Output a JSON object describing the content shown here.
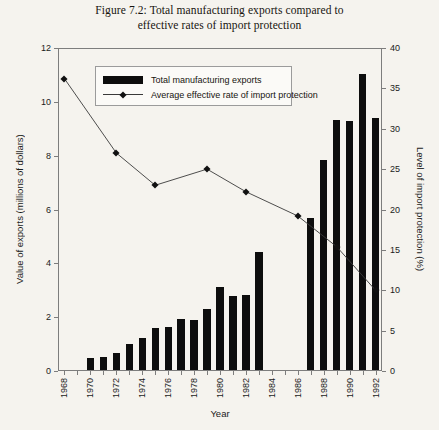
{
  "figure": {
    "title_line1": "Figure 7.2: Total manufacturing exports compared to",
    "title_line2": "effective rates of import protection"
  },
  "legend": {
    "bar_label": "Total manufacturing exports",
    "line_label": "Average effective rate of import protection"
  },
  "chart_data": {
    "type": "bar",
    "title": "Figure 7.2: Total manufacturing exports compared to effective rates of import protection",
    "xlabel": "Year",
    "ylabel": "Value of exports (millions of dollars)",
    "y2label": "Level of import protection (%)",
    "ylim": [
      0,
      12
    ],
    "y2lim": [
      0,
      40
    ],
    "yticks": [
      0,
      2,
      4,
      6,
      8,
      10,
      12
    ],
    "y2ticks": [
      0,
      5,
      10,
      15,
      20,
      25,
      30,
      35,
      40
    ],
    "grid": false,
    "legend_position": "upper-center",
    "x": [
      1968,
      1969,
      1970,
      1971,
      1972,
      1973,
      1974,
      1975,
      1976,
      1977,
      1978,
      1979,
      1980,
      1981,
      1982,
      1983,
      1984,
      1985,
      1986,
      1987,
      1988,
      1989,
      1990,
      1991,
      1992
    ],
    "xtick_labels": [
      "1968",
      "1970",
      "1972",
      "1974",
      "1976",
      "1978",
      "1980",
      "1982",
      "1984",
      "1986",
      "1988",
      "1990",
      "1992"
    ],
    "xticks": [
      1968,
      1970,
      1972,
      1974,
      1976,
      1978,
      1980,
      1982,
      1984,
      1986,
      1988,
      1990,
      1992
    ],
    "series": [
      {
        "name": "Total manufacturing exports",
        "type": "bar",
        "axis": "left",
        "unit": "millions of dollars",
        "color": "#0d0d0d",
        "values": [
          null,
          null,
          0.45,
          0.5,
          0.65,
          0.95,
          1.2,
          1.55,
          1.6,
          1.9,
          1.85,
          2.25,
          3.1,
          2.75,
          2.8,
          4.4,
          null,
          null,
          null,
          5.65,
          7.8,
          9.3,
          9.25,
          11.0,
          9.35
        ]
      },
      {
        "name": "Average effective rate of import protection",
        "type": "line",
        "axis": "right",
        "unit": "%",
        "color": "#3a3a3a",
        "marker": "diamond",
        "points": [
          {
            "x": 1968,
            "y": 36.2
          },
          {
            "x": 1972,
            "y": 27.0
          },
          {
            "x": 1975,
            "y": 23.0
          },
          {
            "x": 1979,
            "y": 25.0
          },
          {
            "x": 1982,
            "y": 22.2
          },
          {
            "x": 1986,
            "y": 19.2
          },
          {
            "x": 1989,
            "y": 15.4
          },
          {
            "x": 1992,
            "y": 10.0
          }
        ]
      }
    ]
  }
}
